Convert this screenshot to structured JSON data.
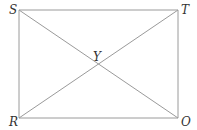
{
  "diagram": {
    "type": "rectangle-with-diagonals",
    "line_color": "#9a9a9a",
    "points": {
      "S": {
        "label": "S",
        "x": 19,
        "y": 10
      },
      "T": {
        "label": "T",
        "x": 178,
        "y": 10
      },
      "R": {
        "label": "R",
        "x": 19,
        "y": 118
      },
      "O": {
        "label": "O",
        "x": 178,
        "y": 118
      },
      "Y": {
        "label": "Y",
        "x": 98,
        "y": 64
      }
    },
    "segments": [
      "ST",
      "TO",
      "OR",
      "RS",
      "SO",
      "RT"
    ]
  }
}
